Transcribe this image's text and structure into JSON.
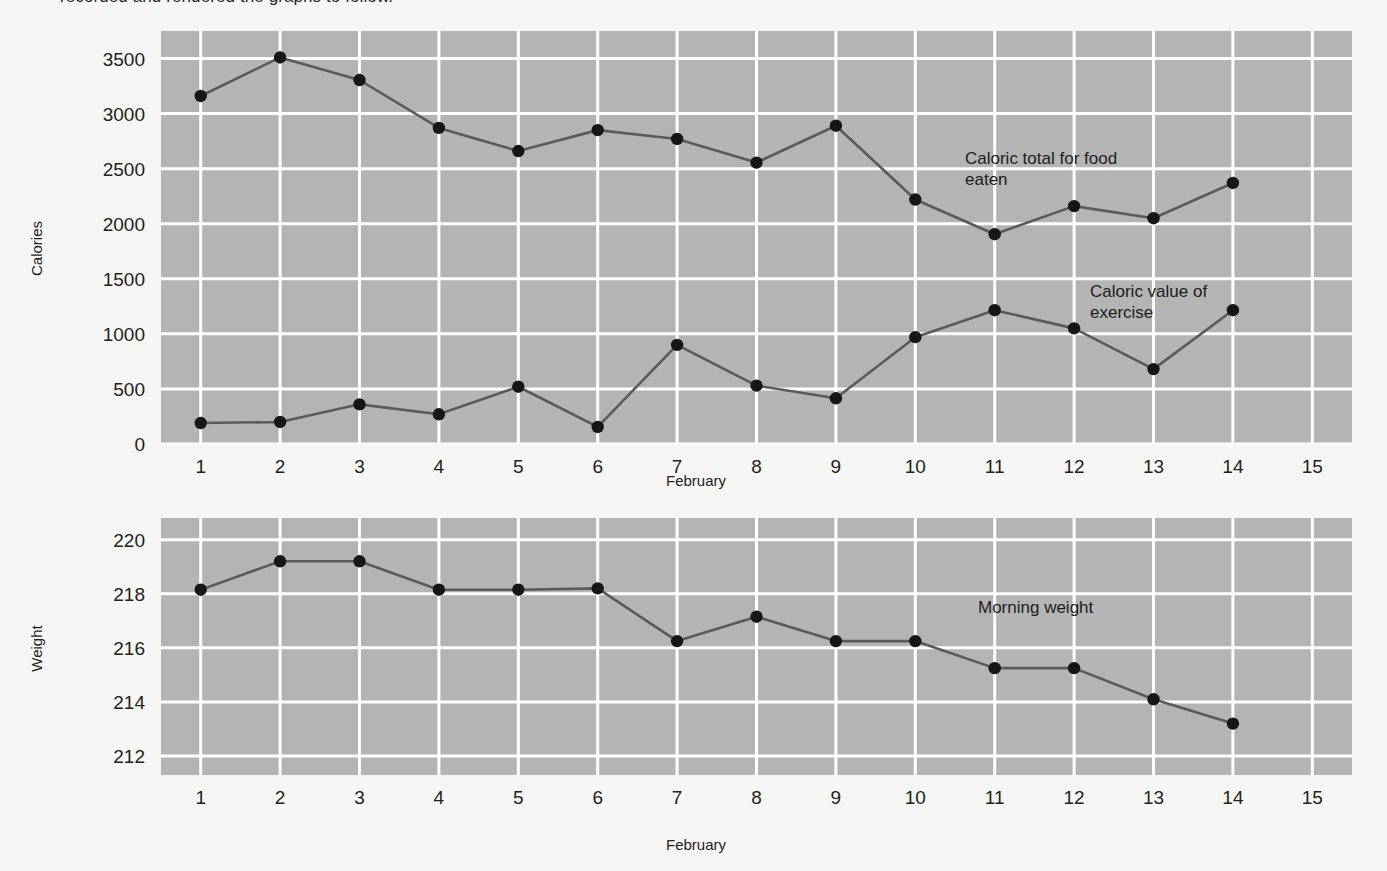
{
  "page": {
    "clipped_top_text": "recorded and rendered the graphs to follow.",
    "background_color": "#f6f6f4",
    "plot_background_color": "#b4b4b4",
    "gridline_color": "#ffffff",
    "series_color": "#5a5a5a",
    "marker_color": "#161616"
  },
  "chart_data": [
    {
      "type": "line",
      "id": "calories-chart",
      "title": "",
      "xlabel": "February",
      "ylabel": "Calories",
      "xlim": [
        0.5,
        15.5
      ],
      "ylim": [
        0,
        3750
      ],
      "grid": true,
      "legend_position": "inline-annotation",
      "x": [
        1,
        2,
        3,
        4,
        5,
        6,
        7,
        8,
        9,
        10,
        11,
        12,
        13,
        14
      ],
      "xticks": [
        "1",
        "2",
        "3",
        "4",
        "5",
        "6",
        "7",
        "8",
        "9",
        "10",
        "11",
        "12",
        "13",
        "14",
        "15"
      ],
      "xtick_values": [
        1,
        2,
        3,
        4,
        5,
        6,
        7,
        8,
        9,
        10,
        11,
        12,
        13,
        14,
        15
      ],
      "yticks": [
        "0",
        "500",
        "1000",
        "1500",
        "2000",
        "2500",
        "3000",
        "3500"
      ],
      "ytick_values": [
        0,
        500,
        1000,
        1500,
        2000,
        2500,
        3000,
        3500
      ],
      "series": [
        {
          "name": "Caloric total for food eaten",
          "annotation": "Caloric total for food\neaten",
          "values": [
            3160,
            3510,
            3305,
            2870,
            2660,
            2850,
            2770,
            2555,
            2890,
            2220,
            1905,
            2160,
            2050,
            2370
          ]
        },
        {
          "name": "Caloric value of exercise",
          "annotation": "Caloric value of\nexercise",
          "values": [
            190,
            200,
            360,
            270,
            520,
            155,
            900,
            530,
            415,
            970,
            1215,
            1050,
            680,
            1215
          ]
        }
      ]
    },
    {
      "type": "line",
      "id": "weight-chart",
      "title": "",
      "xlabel": "February",
      "ylabel": "Weight",
      "xlim": [
        0.5,
        15.5
      ],
      "ylim": [
        211.3,
        220.8
      ],
      "grid": true,
      "legend_position": "inline-annotation",
      "x": [
        1,
        2,
        3,
        4,
        5,
        6,
        7,
        8,
        9,
        10,
        11,
        12,
        13,
        14
      ],
      "xticks": [
        "1",
        "2",
        "3",
        "4",
        "5",
        "6",
        "7",
        "8",
        "9",
        "10",
        "11",
        "12",
        "13",
        "14",
        "15"
      ],
      "xtick_values": [
        1,
        2,
        3,
        4,
        5,
        6,
        7,
        8,
        9,
        10,
        11,
        12,
        13,
        14,
        15
      ],
      "yticks": [
        "212",
        "214",
        "216",
        "218",
        "220"
      ],
      "ytick_values": [
        212,
        214,
        216,
        218,
        220
      ],
      "series": [
        {
          "name": "Morning weight",
          "annotation": "Morning weight",
          "values": [
            218.15,
            219.2,
            219.2,
            218.15,
            218.15,
            218.2,
            216.25,
            217.15,
            216.25,
            216.25,
            215.25,
            215.25,
            214.1,
            213.2
          ]
        }
      ]
    }
  ]
}
